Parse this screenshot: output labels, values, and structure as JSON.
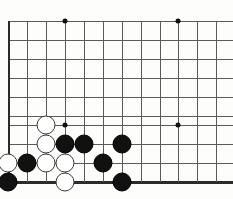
{
  "figure": {
    "width": 233,
    "height": 199,
    "background_color": "#fdfdfc",
    "line_color": "#5a5a5a",
    "edge_color": "#2b2b2b",
    "black_stone_color": "#111111",
    "white_stone_color": "#ffffff",
    "white_stone_outline": "#3a3a3a",
    "stone_diameter": 19,
    "grid_spacing": 19
  },
  "board": {
    "description": "Partial view of a 19x19 Go board showing the lower-left corner region.",
    "vertical_lines_x": [
      8,
      27,
      46,
      65,
      84,
      103,
      122,
      141,
      160,
      178,
      197,
      216
    ],
    "horizontal_lines_y": [
      21,
      40,
      59,
      78,
      97,
      116,
      125,
      144,
      163,
      182
    ],
    "left_edge_x": 8,
    "bottom_edge_y": 182,
    "star_points": [
      {
        "x": 65,
        "y": 21,
        "name": "star-point-upper-left"
      },
      {
        "x": 178,
        "y": 21,
        "name": "star-point-upper-right"
      },
      {
        "x": 65,
        "y": 125,
        "name": "star-point-lower-left"
      },
      {
        "x": 178,
        "y": 125,
        "name": "star-point-lower-right"
      }
    ]
  },
  "stones": [
    {
      "color": "white",
      "x": 46,
      "y": 125,
      "name": "stone-white-1"
    },
    {
      "color": "white",
      "x": 46,
      "y": 144,
      "name": "stone-white-2"
    },
    {
      "color": "black",
      "x": 65,
      "y": 144,
      "name": "stone-black-1"
    },
    {
      "color": "black",
      "x": 84,
      "y": 144,
      "name": "stone-black-2"
    },
    {
      "color": "black",
      "x": 122,
      "y": 144,
      "name": "stone-black-3"
    },
    {
      "color": "white",
      "x": 8,
      "y": 163,
      "name": "stone-white-3"
    },
    {
      "color": "black",
      "x": 27,
      "y": 163,
      "name": "stone-black-4"
    },
    {
      "color": "white",
      "x": 46,
      "y": 163,
      "name": "stone-white-4"
    },
    {
      "color": "white",
      "x": 65,
      "y": 163,
      "name": "stone-white-5"
    },
    {
      "color": "black",
      "x": 103,
      "y": 163,
      "name": "stone-black-5"
    },
    {
      "color": "black",
      "x": 8,
      "y": 182,
      "name": "stone-black-6"
    },
    {
      "color": "white",
      "x": 65,
      "y": 182,
      "name": "stone-white-6"
    },
    {
      "color": "black",
      "x": 122,
      "y": 182,
      "name": "stone-black-7"
    }
  ],
  "counts": {
    "black_stones": 7,
    "white_stones": 6,
    "total_stones": 13
  }
}
